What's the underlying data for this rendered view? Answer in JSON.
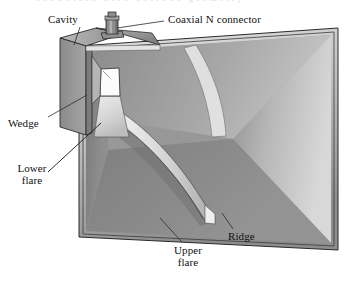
{
  "figure": {
    "background_color": "#ffffff",
    "width": 346,
    "height": 281,
    "top_cropped_text": "bandwidth horn antenna geometry"
  },
  "labels": [
    {
      "id": "cavity",
      "text": "Cavity",
      "x": 48,
      "y": 14,
      "leader": {
        "from": [
          80,
          27
        ],
        "to": [
          74,
          45
        ]
      }
    },
    {
      "id": "coaxial-n-connector",
      "text": "Coaxial N connector",
      "x": 168,
      "y": 14,
      "leader": {
        "from": [
          164,
          21
        ],
        "to": [
          117,
          28
        ]
      }
    },
    {
      "id": "wedge",
      "text": "Wedge",
      "x": 8,
      "y": 118,
      "leader": {
        "from": [
          48,
          117
        ],
        "to": [
          87,
          95
        ]
      }
    },
    {
      "id": "lower-flare",
      "line1": "Lower",
      "line2": "flare",
      "x": 10,
      "y": 163,
      "leader": {
        "from": [
          48,
          172
        ],
        "to": [
          101,
          123
        ]
      }
    },
    {
      "id": "upper-flare",
      "line1": "Upper",
      "line2": "flare",
      "x": 167,
      "y": 245,
      "leader": {
        "from": [
          182,
          242
        ],
        "to": [
          160,
          218
        ]
      }
    },
    {
      "id": "ridge",
      "text": "Ridge",
      "x": 228,
      "y": 231,
      "leader": {
        "from": [
          233,
          229
        ],
        "to": [
          222,
          213
        ]
      }
    }
  ],
  "parts": [
    {
      "id": "cavity-box",
      "name": "Cavity",
      "tone": "#8e8e8e"
    },
    {
      "id": "coax-connector",
      "name": "Coaxial N connector",
      "tone": "#999999"
    },
    {
      "id": "wedge-block",
      "name": "Wedge",
      "tone": "#c9c9c9"
    },
    {
      "id": "lower-flare-surface",
      "name": "Lower flare",
      "tone": "#d6d6d6"
    },
    {
      "id": "upper-flare-surface",
      "name": "Upper flare",
      "tone": "#9b9b9b"
    },
    {
      "id": "ridge-band",
      "name": "Ridge",
      "tone": "#e2e2e2"
    },
    {
      "id": "aperture-frame",
      "name": "Aperture frame",
      "tone": "#b5b5b5"
    },
    {
      "id": "throat-opening",
      "name": "Throat opening",
      "tone": "#fbfbfb"
    }
  ],
  "colors": {
    "outline": "#2a2a2a",
    "leader_line": "#2a2a2a",
    "frame_light": "#d9d9d9",
    "frame_mid": "#aeaeae",
    "frame_dark": "#6f6f6f",
    "wall_dark": "#7d7d7d",
    "wall_mid": "#a0a0a0",
    "wall_light": "#d2d2d2",
    "paper": "#ffffff"
  }
}
